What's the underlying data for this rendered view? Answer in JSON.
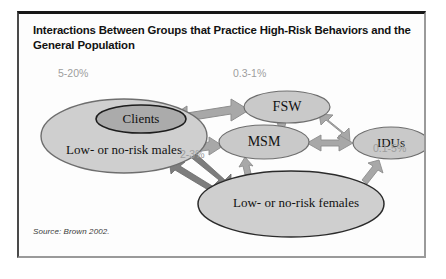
{
  "figure": {
    "title": "Interactions Between Groups that Practice High-Risk Behaviors and the General Population",
    "source": "Source: Brown 2002."
  },
  "colors": {
    "ellipse_fill": "#cfcfcf",
    "ellipse_stroke": "#6e6e6e",
    "clients_fill": "#ababab",
    "clients_stroke": "#1d1d1d",
    "arrow_fill": "#a8a8a8",
    "arrow_stroke": "#8a8a8a",
    "dark_arrow_fill": "#7d7d7d",
    "label_gray": "#9d9d9d",
    "text_black": "#111111",
    "frame_dark": "#171717"
  },
  "nodes": [
    {
      "id": "low-risk-males",
      "label": "Low- or no-risk males",
      "cx": 105,
      "cy": 122,
      "rx": 83,
      "ry": 37
    },
    {
      "id": "clients",
      "label": "Clients",
      "cx": 122,
      "cy": 105,
      "rx": 45,
      "ry": 14
    },
    {
      "id": "fsw",
      "label": "FSW",
      "cx": 268,
      "cy": 93,
      "rx": 43,
      "ry": 16
    },
    {
      "id": "msm",
      "label": "MSM",
      "cx": 245,
      "cy": 128,
      "rx": 45,
      "ry": 17
    },
    {
      "id": "idus",
      "label": "IDUs",
      "cx": 372,
      "cy": 129,
      "rx": 38,
      "ry": 16
    },
    {
      "id": "low-risk-females",
      "label": "Low- or no-risk females",
      "cx": 272,
      "cy": 190,
      "rx": 93,
      "ry": 33
    }
  ],
  "percent_labels": [
    {
      "id": "clients-prevalence",
      "text": "5-20%",
      "x": 56,
      "y": 68
    },
    {
      "id": "fsw-prevalence",
      "text": "0.3-1%",
      "x": 231,
      "y": 68
    },
    {
      "id": "females-prevalence",
      "text": "2-3%",
      "x": 178,
      "y": 149
    },
    {
      "id": "idus-prevalence",
      "text": "0.1-5%",
      "x": 371,
      "y": 143
    }
  ],
  "edges": [
    {
      "id": "clients-fsw",
      "from": "clients",
      "to": "fsw",
      "style": "thick-double"
    },
    {
      "id": "clients-msm",
      "from": "clients",
      "to": "msm",
      "style": "thin-double"
    },
    {
      "id": "fsw-msm",
      "from": "fsw",
      "to": "msm",
      "style": "thin-double"
    },
    {
      "id": "fsw-idus",
      "from": "fsw",
      "to": "idus",
      "style": "thin-double"
    },
    {
      "id": "msm-idus",
      "from": "msm",
      "to": "idus",
      "style": "thin-double"
    },
    {
      "id": "msm-females",
      "from": "msm",
      "to": "low-risk-females",
      "style": "thin-double"
    },
    {
      "id": "idus-females",
      "from": "idus",
      "to": "low-risk-females",
      "style": "thin-double"
    },
    {
      "id": "clients-females",
      "from": "clients",
      "to": "low-risk-females",
      "style": "dark-single"
    },
    {
      "id": "females-males",
      "from": "low-risk-females",
      "to": "low-risk-males",
      "style": "dark-single"
    }
  ]
}
